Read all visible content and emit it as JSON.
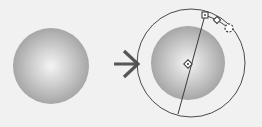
{
  "diagram": {
    "title": "Radial gradient applied to circle, before and after showing gradient controls",
    "colors": {
      "background": "#f1f1f1",
      "gradient_center": "#f4f4f4",
      "gradient_edge": "#a6a6a6",
      "stroke": "#4a4a4a",
      "arrow": "#555555"
    },
    "nodes": [
      {
        "id": "before",
        "label": "Sphere with radial gradient (before)",
        "cx": 51,
        "cy": 66,
        "r": 38
      },
      {
        "id": "arrow",
        "label": "Transformation arrow",
        "cx": 127,
        "cy": 64
      },
      {
        "id": "after",
        "label": "Sphere with gradient editing controls (after)",
        "cx": 188,
        "cy": 63,
        "r": 37
      },
      {
        "id": "outer-ring",
        "label": "Gradient radius ring",
        "cx": 191,
        "cy": 63,
        "r": 54
      },
      {
        "id": "axis-line",
        "label": "Gradient axis line",
        "x1": 205,
        "y1": 15,
        "x2": 178,
        "y2": 114
      },
      {
        "id": "center-handle",
        "label": "Gradient center handle",
        "cx": 188,
        "cy": 64
      },
      {
        "id": "square-handle",
        "label": "Gradient radius handle (square)",
        "cx": 205,
        "cy": 15
      },
      {
        "id": "diamond-handle",
        "label": "Gradient focal handle (diamond)",
        "cx": 217,
        "cy": 20
      },
      {
        "id": "rotate-handle",
        "label": "Gradient rotate handle (dashed circle)",
        "cx": 229,
        "cy": 28
      }
    ],
    "edges": [
      {
        "from": "before",
        "to": "after",
        "label": "apply gradient tool"
      }
    ]
  }
}
